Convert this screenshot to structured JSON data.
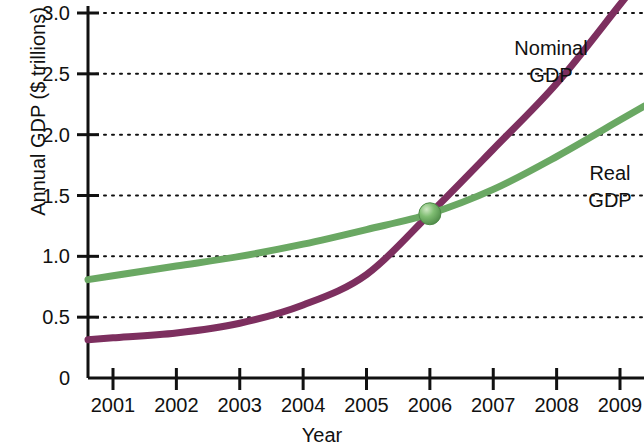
{
  "chart_data": {
    "type": "line",
    "title": "",
    "xlabel": "Year",
    "ylabel": "Annual GDP ($ trillions)",
    "x": [
      2001,
      2002,
      2003,
      2004,
      2005,
      2006,
      2007,
      2008,
      2009
    ],
    "xtick_labels": [
      "2001",
      "2002",
      "2003",
      "2004",
      "2005",
      "2006",
      "2007",
      "2008",
      "2009"
    ],
    "ytick_labels": [
      "0",
      "0.5",
      "1.0",
      "1.5",
      "2.0",
      "2.5",
      "3.0"
    ],
    "ytick_values": [
      0,
      0.5,
      1.0,
      1.5,
      2.0,
      2.5,
      3.0
    ],
    "xlim": [
      2001,
      2009
    ],
    "ylim": [
      0,
      3.1
    ],
    "grid": "horizontal-dotted",
    "legend": "inline-labels",
    "series": [
      {
        "name": "Nominal GDP",
        "color": "#7d2f5f",
        "label_text_line1": "Nominal",
        "label_text_line2": "GDP",
        "values": [
          0.33,
          0.37,
          0.45,
          0.6,
          0.85,
          1.35,
          1.88,
          2.42,
          3.07
        ]
      },
      {
        "name": "Real GDP",
        "color": "#6aa863",
        "label_text_line1": "Real",
        "label_text_line2": "GDP",
        "values": [
          0.84,
          0.92,
          1.0,
          1.1,
          1.22,
          1.35,
          1.55,
          1.82,
          2.12
        ]
      }
    ],
    "annotations": [
      {
        "name": "intersection-marker",
        "x": 2006,
        "y": 1.35,
        "shape": "sphere",
        "color": "#6aa863"
      }
    ]
  },
  "labels": {
    "y_axis_title": "Annual GDP ($ trillions)",
    "x_axis_title": "Year"
  }
}
